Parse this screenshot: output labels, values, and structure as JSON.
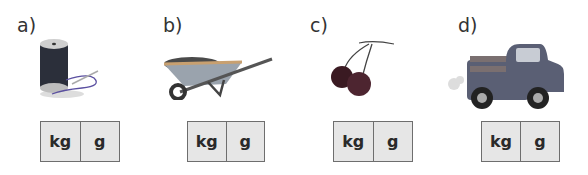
{
  "items": [
    {
      "label": "a)",
      "object": "spool of thread",
      "icon": "thread-spool-icon",
      "units": [
        "kg",
        "g"
      ]
    },
    {
      "label": "b)",
      "object": "wheelbarrow",
      "icon": "wheelbarrow-icon",
      "units": [
        "kg",
        "g"
      ]
    },
    {
      "label": "c)",
      "object": "cherries",
      "icon": "cherries-icon",
      "units": [
        "kg",
        "g"
      ]
    },
    {
      "label": "d)",
      "object": "pickup truck",
      "icon": "truck-icon",
      "units": [
        "kg",
        "g"
      ]
    }
  ],
  "colors": {
    "box_fill": "#e6e6e6",
    "box_border": "#6e6e6e",
    "text": "#2a2a2a"
  }
}
